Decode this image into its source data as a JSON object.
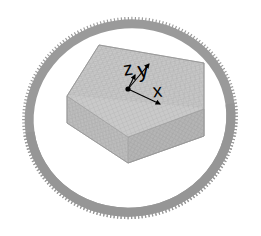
{
  "scene": {
    "title": "3D Mesh Visualization",
    "background_color": "#ffffff",
    "width": 261,
    "height": 236
  },
  "coil": {
    "name": "spiked-torus-coil",
    "center_x": 130,
    "center_y": 118,
    "radius_x": 101,
    "radius_y": 94,
    "rotation_deg": -8,
    "band_color": "#9a9a9a",
    "band_edge_color": "#8e8e8e",
    "band_thickness": 9,
    "spike_color": "#9a9a9a",
    "spike_count": 190,
    "spike_length": 7,
    "spike_direction": "outward"
  },
  "slab": {
    "name": "mesh-slab-box",
    "face_color": "#c2c2c2",
    "top_color": "#c8c8c8",
    "side_color": "#b4b4b4",
    "front_color": "#bcbcbc",
    "edge_color": "#9d9d9d",
    "mesh_line_color": "#aaaaaa",
    "mesh_rows": 26,
    "mesh_cols": 26,
    "depth": 44
  },
  "axes": {
    "name": "coordinate-triad",
    "origin_x": 128,
    "origin_y": 89,
    "color": "#000000",
    "items": [
      {
        "id": "z",
        "label": "z",
        "label_x": 129,
        "label_y": 75,
        "tip_x": 135,
        "tip_y": 73,
        "font_size": 19
      },
      {
        "id": "y",
        "label": "y",
        "label_x": 144,
        "label_y": 76,
        "tip_x": 151,
        "tip_y": 60,
        "font_size": 21
      },
      {
        "id": "x",
        "label": "x",
        "label_x": 157,
        "label_y": 97,
        "tip_x": 160,
        "tip_y": 104,
        "font_size": 19
      }
    ]
  }
}
